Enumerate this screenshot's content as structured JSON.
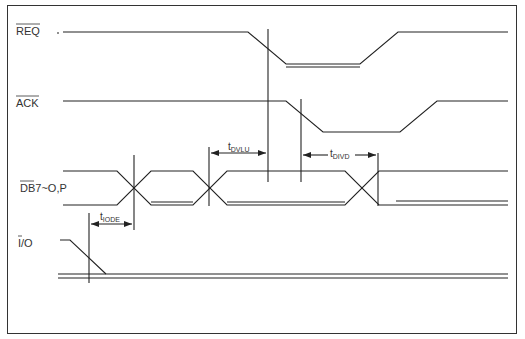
{
  "diagram": {
    "title": "",
    "signals": [
      {
        "name": "REQ",
        "overbar": true
      },
      {
        "name": "ACK",
        "overbar": true
      },
      {
        "name": "DB7~O,P",
        "overbar": true
      },
      {
        "name": "I/O",
        "overbar_part": "I"
      }
    ],
    "timing_labels": [
      {
        "main": "t",
        "sub": "DVLU"
      },
      {
        "main": "t",
        "sub": "DIVD"
      },
      {
        "main": "t",
        "sub": "IODE"
      }
    ]
  }
}
